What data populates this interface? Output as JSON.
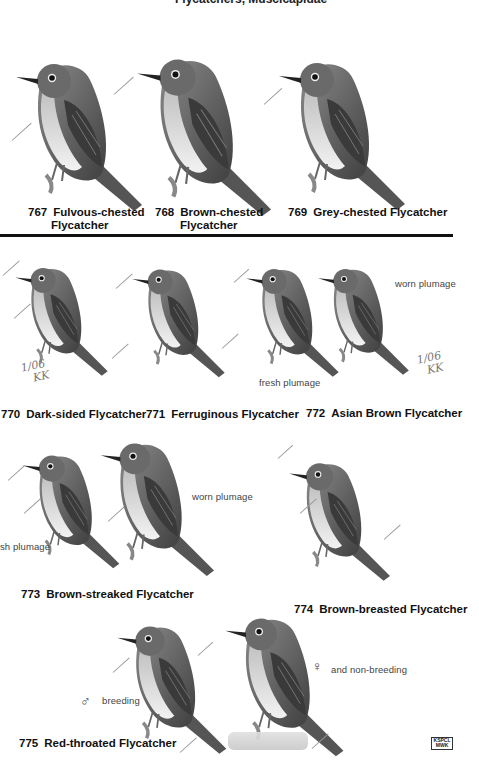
{
  "page": {
    "header_cut_text": "Flycatchers, Muscicapidae"
  },
  "species": [
    {
      "number": "767",
      "name_line1": "Fulvous-chested",
      "name_line2": "Flycatcher"
    },
    {
      "number": "768",
      "name_line1": "Brown-chested",
      "name_line2": "Flycatcher"
    },
    {
      "number": "769",
      "name_line1": "Grey-chested Flycatcher",
      "name_line2": ""
    },
    {
      "number": "770",
      "name_line1": "Dark-sided Flycatcher",
      "name_line2": ""
    },
    {
      "number": "771",
      "name_line1": "Ferruginous Flycatcher",
      "name_line2": ""
    },
    {
      "number": "772",
      "name_line1": "Asian Brown Flycatcher",
      "name_line2": ""
    },
    {
      "number": "773",
      "name_line1": "Brown-streaked Flycatcher",
      "name_line2": ""
    },
    {
      "number": "774",
      "name_line1": "Brown-breasted Flycatcher",
      "name_line2": ""
    },
    {
      "number": "775",
      "name_line1": "Red-throated Flycatcher",
      "name_line2": ""
    }
  ],
  "notes": {
    "worn_plumage_772": "worn plumage",
    "fresh_plumage_772": "fresh plumage",
    "worn_plumage_773": "worn plumage",
    "fresh_plumage_773": "sh plumage",
    "male_symbol": "♂",
    "male_label": "breeding",
    "female_symbol": "♀",
    "female_label": "and non-breeding"
  },
  "handwriting": {
    "sig_770_line1": "1/06",
    "sig_770_line2": "KK",
    "sig_772_line1": "1/06",
    "sig_772_line2": "KK"
  },
  "stamp": {
    "line1": "KSPCL",
    "line2": "MWK"
  },
  "colors": {
    "ink": "#111111",
    "bird_dark": "#4a4a4a",
    "bird_mid": "#7a7a7a",
    "bird_light": "#d8d8d8",
    "leader_line": "#999999"
  }
}
